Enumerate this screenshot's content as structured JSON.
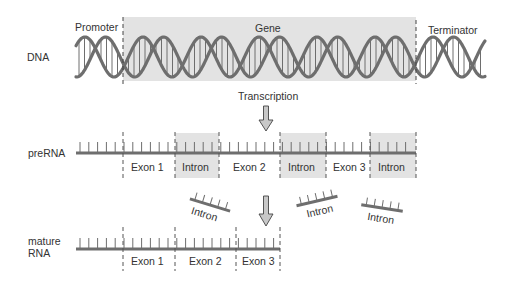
{
  "diagram": {
    "colors": {
      "strand": "#6e6e6e",
      "shade": "#e3e3e3",
      "dash": "#555555",
      "text": "#333333",
      "arrow_fill": "#c8c8c8"
    },
    "dna": {
      "row_label": "DNA",
      "promoter_label": "Promoter",
      "gene_label": "Gene",
      "terminator_label": "Terminator"
    },
    "step1": {
      "label": "Transcription",
      "icon": "down-arrow-icon"
    },
    "prerna": {
      "row_label": "preRNA",
      "segments": [
        {
          "label": "",
          "type": "leader"
        },
        {
          "label": "Exon 1",
          "type": "exon"
        },
        {
          "label": "Intron",
          "type": "intron"
        },
        {
          "label": "Exon 2",
          "type": "exon"
        },
        {
          "label": "Intron",
          "type": "intron"
        },
        {
          "label": "Exon 3",
          "type": "exon"
        },
        {
          "label": "Intron",
          "type": "intron"
        }
      ]
    },
    "excised_introns": [
      {
        "label": "Intron"
      },
      {
        "label": "Intron"
      },
      {
        "label": "Intron"
      }
    ],
    "step2": {
      "icon": "down-arrow-icon"
    },
    "mature_rna": {
      "row_label_line1": "mature",
      "row_label_line2": "RNA",
      "segments": [
        {
          "label": "",
          "type": "leader"
        },
        {
          "label": "Exon 1",
          "type": "exon"
        },
        {
          "label": "Exon 2",
          "type": "exon"
        },
        {
          "label": "Exon 3",
          "type": "exon"
        }
      ]
    }
  }
}
